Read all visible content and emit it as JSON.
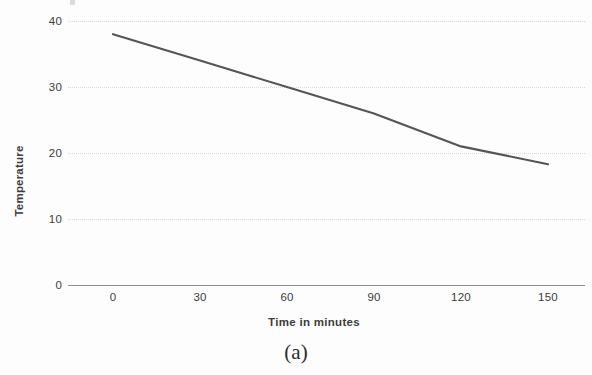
{
  "figure": {
    "caption": "(a)"
  },
  "chart_data": {
    "type": "line",
    "title": "",
    "subtitle": "",
    "xlabel": "Time in minutes",
    "ylabel": "Temperature",
    "x": [
      0,
      30,
      60,
      90,
      120,
      150
    ],
    "values": [
      38,
      34,
      30,
      26,
      21,
      18.3
    ],
    "series": [
      {
        "name": "Temperature",
        "values": [
          38,
          34,
          30,
          26,
          21,
          18.3
        ]
      }
    ],
    "xticks": [
      "0",
      "30",
      "60",
      "90",
      "120",
      "150"
    ],
    "xtick_values": [
      0,
      30,
      60,
      90,
      120,
      150
    ],
    "yticks": [
      "0",
      "10",
      "20",
      "30",
      "40"
    ],
    "ytick_values": [
      0,
      10,
      20,
      30,
      40
    ],
    "xlim": [
      -10,
      170
    ],
    "ylim": [
      0,
      43
    ],
    "grid": "horizontal-dotted",
    "legend": "none",
    "line_color": "#555555",
    "grid_color": "#d8d8d8",
    "axis_color": "#8f8f8f",
    "text_color": "#3b3b3b"
  }
}
